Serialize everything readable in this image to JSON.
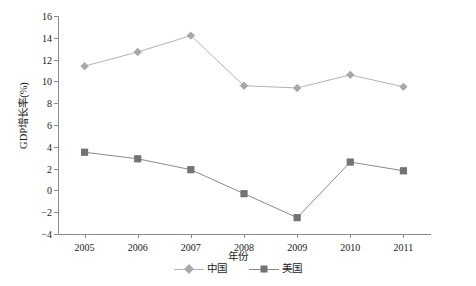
{
  "chart_data": {
    "type": "line",
    "title": "",
    "xlabel": "年份",
    "ylabel": "GDP增长率(%)",
    "categories": [
      "2005",
      "2006",
      "2007",
      "2008",
      "2009",
      "2010",
      "2011"
    ],
    "series": [
      {
        "name": "中国",
        "marker": "diamond",
        "color": "#a8a8a8",
        "line_color": "#b4b4b4",
        "values": [
          11.4,
          12.7,
          14.2,
          9.6,
          9.4,
          10.6,
          9.5
        ]
      },
      {
        "name": "美国",
        "marker": "square",
        "color": "#737373",
        "line_color": "#8a8a8a",
        "values": [
          3.5,
          2.9,
          1.9,
          -0.3,
          -2.5,
          2.6,
          1.8
        ]
      }
    ],
    "ylim": [
      -4,
      16
    ],
    "ytick_step": 2,
    "yticks": [
      "16",
      "14",
      "12",
      "10",
      "8",
      "6",
      "4",
      "2",
      "0",
      "-2",
      "-4"
    ],
    "grid": false,
    "legend_position": "bottom"
  },
  "axis": {
    "color": "#8c8c8c"
  }
}
